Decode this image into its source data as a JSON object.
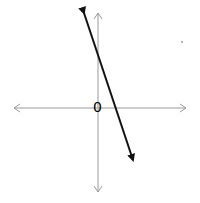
{
  "diagram": {
    "type": "coordinate-plane-line",
    "axes": {
      "color": "#9a9a9a",
      "x_axis": {
        "y": 108,
        "x_start": 14,
        "x_end": 186
      },
      "y_axis": {
        "x": 98,
        "y_start": 13,
        "y_end": 192
      }
    },
    "origin_label": "0",
    "line": {
      "color": "#111111",
      "from": [
        84,
        13
      ],
      "to": [
        133,
        160
      ],
      "arrows": "both"
    },
    "stray_dot": [
      182,
      42
    ]
  }
}
